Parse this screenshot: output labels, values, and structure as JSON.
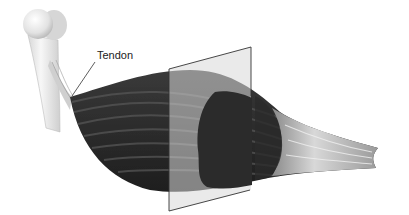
{
  "figure": {
    "labels": [
      {
        "id": "tendon",
        "text": "Tendon"
      }
    ],
    "parts": [
      "bone",
      "tendon",
      "muscle-belly",
      "cross-section-plane",
      "distal-tendon"
    ],
    "colors": {
      "background": "#ffffff",
      "bone": "#e8e8e8",
      "muscle": "#2e2e2e",
      "muscle_stripe": "#4a4a4a",
      "plane": "#d8d8d8",
      "plane_edge": "#333333",
      "tendon": "#d0d0d0"
    }
  }
}
